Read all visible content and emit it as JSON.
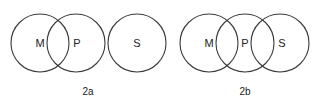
{
  "diagrams": [
    {
      "caption": "2a",
      "circles": [
        {
          "label": "M",
          "cx": 40,
          "cy": 43,
          "r": 29
        },
        {
          "label": "P",
          "cx": 76,
          "cy": 43,
          "r": 29
        },
        {
          "label": "S",
          "cx": 137,
          "cy": 43,
          "r": 29
        }
      ]
    },
    {
      "caption": "2b",
      "circles": [
        {
          "label": "M",
          "cx": 209,
          "cy": 43,
          "r": 29
        },
        {
          "label": "P",
          "cx": 245,
          "cy": 43,
          "r": 29
        },
        {
          "label": "S",
          "cx": 280,
          "cy": 43,
          "r": 29
        }
      ]
    }
  ],
  "colors": {
    "stroke": "#3a3a3a",
    "text": "#222222",
    "background": "#ffffff"
  }
}
